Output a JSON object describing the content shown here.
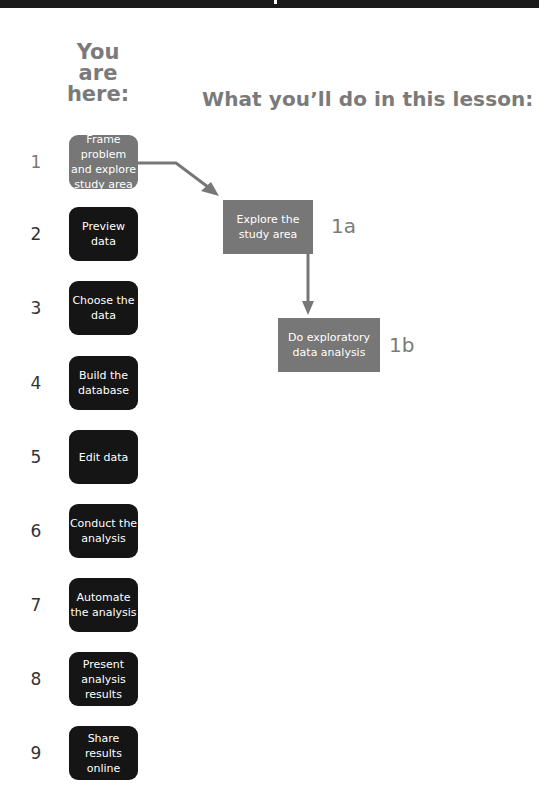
{
  "header": {
    "you_are_here": "You are here:",
    "lesson_title": "What you’ll do in this lesson:"
  },
  "steps": [
    {
      "number": "1",
      "label": "Frame problem and explore study area",
      "current": true
    },
    {
      "number": "2",
      "label": "Preview data",
      "current": false
    },
    {
      "number": "3",
      "label": "Choose the data",
      "current": false
    },
    {
      "number": "4",
      "label": "Build the database",
      "current": false
    },
    {
      "number": "5",
      "label": "Edit data",
      "current": false
    },
    {
      "number": "6",
      "label": "Conduct the analysis",
      "current": false
    },
    {
      "number": "7",
      "label": "Automate the analysis",
      "current": false
    },
    {
      "number": "8",
      "label": "Present analysis results",
      "current": false
    },
    {
      "number": "9",
      "label": "Share results online",
      "current": false
    }
  ],
  "tasks": [
    {
      "id": "1a",
      "label": "Explore the study area"
    },
    {
      "id": "1b",
      "label": "Do exploratory data analysis"
    }
  ],
  "colors": {
    "current_step": "#777777",
    "step": "#151515",
    "task": "#777777",
    "heading": "#7a7a7a"
  }
}
